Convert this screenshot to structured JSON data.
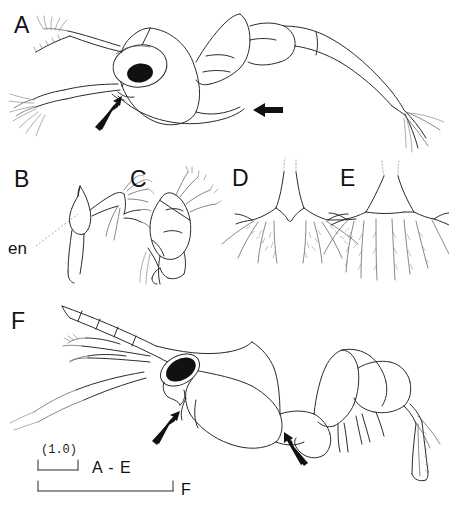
{
  "figure": {
    "type": "scientific-plate",
    "background_color": "#ffffff",
    "ink_color": "#1a1a1a",
    "panels": [
      {
        "id": "A",
        "label": "A",
        "content": "whole larva in lateral view with large oval eye, antennae, segmented abdomen and setose tail",
        "pointers": 2
      },
      {
        "id": "B",
        "label": "B",
        "content": "appendage with endopod, leader line annotation",
        "pointers": 0
      },
      {
        "id": "C",
        "label": "C",
        "content": "appendage with plumose setae",
        "pointers": 0
      },
      {
        "id": "D",
        "label": "D",
        "content": "telson / caudal region with marginal setae",
        "pointers": 0
      },
      {
        "id": "E",
        "label": "E",
        "content": "telson / caudal region with longer marginal setae",
        "pointers": 0
      },
      {
        "id": "F",
        "label": "F",
        "content": "later-stage larva in lateral view with serrate rostrum and stalked eye",
        "pointers": 2
      }
    ],
    "annotations": [
      {
        "name": "en",
        "text": "en",
        "leader": "dotted",
        "panel": "B"
      }
    ],
    "scale_bars": [
      {
        "label": "A - E",
        "unit_label": "(1.0)",
        "length_px": 40
      },
      {
        "label": "F",
        "unit_label": "",
        "length_px": 135
      }
    ],
    "caption_sliver": ""
  }
}
